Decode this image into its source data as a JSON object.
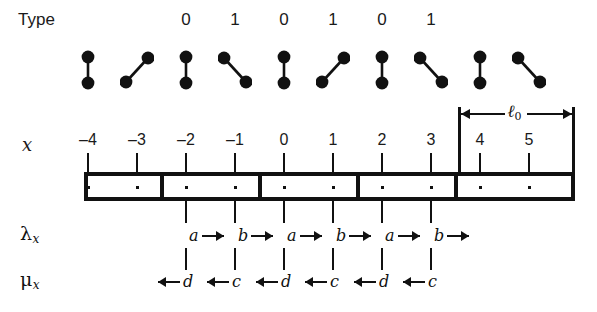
{
  "figure": {
    "width": 597,
    "height": 312,
    "background": "#ffffff",
    "ink": "#111111"
  },
  "rows": {
    "type_label": "Type",
    "x_label": "x",
    "lambda_label": "λ",
    "lambda_subscript": "x",
    "mu_label": "μ",
    "mu_subscript": "x"
  },
  "axis": {
    "tick_values": [
      "–4",
      "–3",
      "–2",
      "–1",
      "0",
      "1",
      "2",
      "3",
      "4",
      "5"
    ],
    "tick_x": [
      88,
      137,
      186,
      235,
      284,
      333,
      382,
      431,
      480,
      529
    ],
    "spacing": 49
  },
  "type_row": {
    "labels": [
      "0",
      "1",
      "0",
      "1",
      "0",
      "1"
    ],
    "label_tick_indices": [
      2,
      3,
      4,
      5,
      6,
      7
    ]
  },
  "dumbbells": {
    "orientations": [
      "vertical",
      "diagonal-up",
      "vertical",
      "diagonal-down",
      "vertical",
      "diagonal-up",
      "vertical",
      "diagonal-down",
      "vertical",
      "diagonal-down"
    ],
    "count": 10,
    "dot_color": "#111111"
  },
  "box": {
    "left": 84,
    "right": 575,
    "top": 172,
    "bottom": 201,
    "border_width": 4,
    "cell_count": 5,
    "cell_divider_tick_indices": [
      2,
      4,
      6,
      8
    ],
    "site_dot_tick_indices": [
      0,
      1,
      2,
      3,
      4,
      5,
      6,
      7,
      8,
      9
    ]
  },
  "lambda_row": {
    "letters": [
      "a",
      "b",
      "a",
      "b",
      "a",
      "b"
    ],
    "tick_indices": [
      2,
      3,
      4,
      5,
      6,
      7
    ],
    "arrow_direction": "right"
  },
  "mu_row": {
    "letters": [
      "d",
      "c",
      "d",
      "c",
      "d",
      "c"
    ],
    "tick_indices": [
      2,
      3,
      4,
      5,
      6,
      7
    ],
    "arrow_direction": "left"
  },
  "ell_bracket": {
    "label": "ℓ",
    "subscript": "0",
    "from_tick_index": 8,
    "to_tick_index": 9,
    "left_px": 458,
    "right_px": 575,
    "top_px": 107
  }
}
